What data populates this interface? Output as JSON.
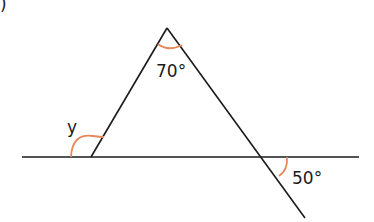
{
  "diagram": {
    "part_marker": ")",
    "angles": {
      "apex": "70°",
      "exterior_left": "y",
      "exterior_right": "50°"
    },
    "colors": {
      "line": "#1a1a1a",
      "arc": "#e8875a"
    }
  }
}
